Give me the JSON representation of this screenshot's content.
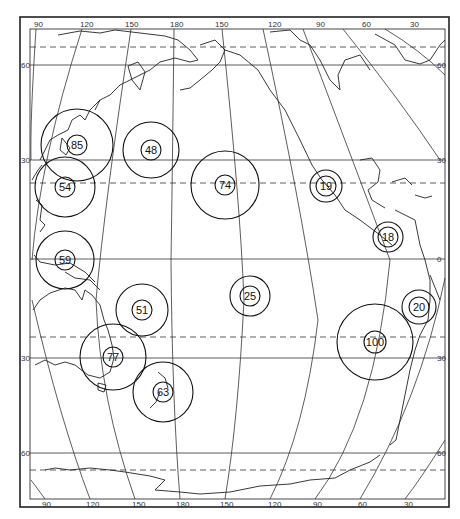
{
  "map": {
    "title": "",
    "type": "Pacific Ocean map with proportional circle markers",
    "longitude_labels_top": [
      "90",
      "120",
      "150",
      "180",
      "150",
      "120",
      "90",
      "60",
      "30"
    ],
    "longitude_labels_bottom": [
      "90",
      "120",
      "150",
      "180",
      "150",
      "120",
      "90",
      "60",
      "30"
    ],
    "latitude_labels_left": [
      "60",
      "30",
      "30",
      "60"
    ],
    "latitude_labels_right": [
      "60",
      "30",
      "0",
      "30",
      "60"
    ],
    "parallels": [
      {
        "label": "60",
        "style": "solid"
      },
      {
        "label": "Arctic Circle",
        "style": "dashed"
      },
      {
        "label": "30",
        "style": "solid"
      },
      {
        "label": "Tropic of Cancer",
        "style": "dashed"
      },
      {
        "label": "0",
        "style": "solid"
      },
      {
        "label": "Tropic of Capricorn",
        "style": "dashed"
      },
      {
        "label": "30",
        "style": "solid"
      },
      {
        "label": "60",
        "style": "solid"
      },
      {
        "label": "Antarctic Circle",
        "style": "dashed"
      }
    ],
    "markers": [
      {
        "value": "85",
        "region": "Japan / Korea"
      },
      {
        "value": "54",
        "region": "South China / Taiwan"
      },
      {
        "value": "48",
        "region": "Northwest Pacific"
      },
      {
        "value": "74",
        "region": "Hawaii"
      },
      {
        "value": "19",
        "region": "Mexico Pacific coast"
      },
      {
        "value": "18",
        "region": "Central America / Panama"
      },
      {
        "value": "59",
        "region": "Indonesia / New Guinea"
      },
      {
        "value": "25",
        "region": "French Polynesia"
      },
      {
        "value": "51",
        "region": "Melanesia / Vanuatu"
      },
      {
        "value": "20",
        "region": "Peru"
      },
      {
        "value": "100",
        "region": "Chile offshore"
      },
      {
        "value": "77",
        "region": "Eastern Australia"
      },
      {
        "value": "63",
        "region": "New Zealand"
      }
    ],
    "colors": {
      "ink": "#111111",
      "background": "#ffffff"
    }
  }
}
